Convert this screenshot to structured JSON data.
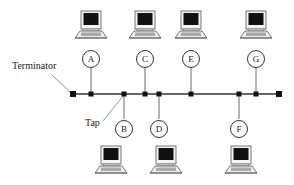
{
  "diagram": {
    "type": "bus-topology-network",
    "labels": {
      "terminator": "Terminator",
      "tap": "Tap"
    },
    "bus": {
      "y": 94,
      "x_start": 73,
      "x_end": 279
    },
    "stations": [
      {
        "id": "A",
        "x": 91,
        "side": "top"
      },
      {
        "id": "B",
        "x": 124,
        "side": "bottom"
      },
      {
        "id": "C",
        "x": 145,
        "side": "top"
      },
      {
        "id": "D",
        "x": 159,
        "side": "bottom"
      },
      {
        "id": "E",
        "x": 191,
        "side": "top"
      },
      {
        "id": "F",
        "x": 239,
        "side": "bottom"
      },
      {
        "id": "G",
        "x": 256,
        "side": "top"
      }
    ]
  }
}
